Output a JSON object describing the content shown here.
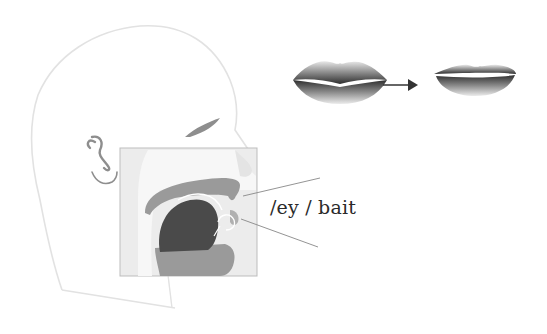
{
  "diagram": {
    "type": "articulation-diagram",
    "phoneme_label": "/ey / bait",
    "transition_arrow": "→",
    "elements": {
      "head_outline": "head-profile",
      "inset": "vocal-tract-cross-section",
      "lips_start": "lips-neutral",
      "lips_end": "lips-spread"
    },
    "colors": {
      "outline": "#e0e0e0",
      "inset_bg": "#ececec",
      "tissue": "#9a9a9a",
      "tongue": "#4a4a4a",
      "eyebrow": "#8c8c8c",
      "pointer_lines": "#888888",
      "text": "#2a2a2a"
    }
  }
}
